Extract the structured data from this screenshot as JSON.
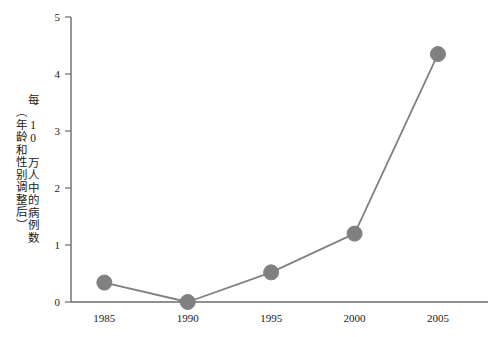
{
  "chart_data": {
    "type": "line",
    "title": "",
    "xlabel": "",
    "ylabel": "每 10 万人中的病例数（年龄和性别调整后）",
    "ylabel_lines": [
      "每 10 万人中的病例数",
      "（年龄和性别调整后）"
    ],
    "categories": [
      "1985",
      "1990",
      "1995",
      "2000",
      "2005"
    ],
    "x": [
      1985,
      1990,
      1995,
      2000,
      2005
    ],
    "values": [
      0.34,
      0.0,
      0.52,
      1.2,
      4.35
    ],
    "series": [
      {
        "name": "每 10 万人中的病例数",
        "values": [
          0.34,
          0.0,
          0.52,
          1.2,
          4.35
        ]
      }
    ],
    "ylim": [
      0,
      5
    ],
    "xlim": [
      1983,
      2008
    ],
    "ytick_labels": [
      "0",
      "1",
      "2",
      "3",
      "4",
      "5"
    ],
    "yticks": [
      0,
      1,
      2,
      3,
      4,
      5
    ],
    "xtick_labels": [
      "1985",
      "1990",
      "1995",
      "2000",
      "2005"
    ],
    "grid": false,
    "legend": "none",
    "marker": "circle",
    "colors": {
      "line": "#808080",
      "marker": "#808080",
      "axis": "#6b6b6b",
      "text": "#1a1a1a",
      "background": "#ffffff"
    }
  }
}
